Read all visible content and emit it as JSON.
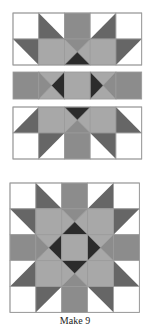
{
  "figure": {
    "caption": "Make 9",
    "colors": {
      "background": "#ffffff",
      "dark_triangle": "#666666",
      "medium_rect": "#8c8c8c",
      "light_square": "#a8a8a8",
      "center_hourglass": "#9a9a9a",
      "black_triangle": "#2b2b2b",
      "seam": "#9a9a9a"
    },
    "rows": [
      {
        "name": "top-strip",
        "label": "Rows 1-2 assembled"
      },
      {
        "name": "middle-strip",
        "label": "Row 3 assembled"
      },
      {
        "name": "bottom-strip",
        "label": "Rows 4-5 assembled"
      },
      {
        "name": "finished-block",
        "label": "Finished star block"
      }
    ]
  }
}
